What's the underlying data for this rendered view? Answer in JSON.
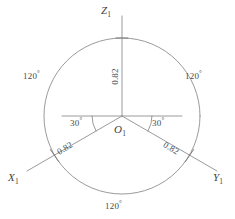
{
  "figure": {
    "background_color": "#ffffff",
    "line_color": "#8f8f8f",
    "text_color": "#4a4a4a",
    "circle": {
      "cx": 122,
      "cy": 116,
      "r": 78
    },
    "axes": [
      {
        "id": "z",
        "label_text": "Z",
        "label_sub": "1",
        "angle_deg": 90,
        "length_label": "0.82"
      },
      {
        "id": "x",
        "label_text": "X",
        "label_sub": "1",
        "angle_deg": 210,
        "length_label": "0.82"
      },
      {
        "id": "y",
        "label_text": "Y",
        "label_sub": "1",
        "angle_deg": 330,
        "length_label": "0.82"
      }
    ],
    "origin": {
      "label_text": "O",
      "label_sub": "1"
    },
    "angles_between_axes": [
      {
        "id": "left",
        "value": "120",
        "unit": "°"
      },
      {
        "id": "right",
        "value": "120",
        "unit": "°"
      },
      {
        "id": "bottom",
        "value": "120",
        "unit": "°"
      }
    ],
    "angles_from_horizontal": [
      {
        "id": "left",
        "value": "30",
        "unit": "°"
      },
      {
        "id": "right",
        "value": "30",
        "unit": "°"
      }
    ],
    "length_labels": {
      "z": "0.82",
      "x": "0.82",
      "y": "0.82"
    }
  }
}
